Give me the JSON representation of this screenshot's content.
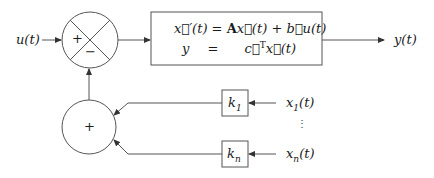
{
  "diagram": {
    "type": "block-diagram",
    "colors": {
      "stroke": "#555555",
      "text": "#1a1a1a",
      "background": "#ffffff"
    },
    "input": {
      "label": "u(t)"
    },
    "output": {
      "label": "y(t)"
    },
    "summing_junction_top": {
      "signs": {
        "left": "+",
        "bottom": "−"
      }
    },
    "summing_junction_bottom": {
      "sign": "+"
    },
    "state_space_block": {
      "line1": {
        "lhs": "x⃗′(t)",
        "op": "=",
        "rhs_A": "A",
        "rhs_x": "x⃗(t)",
        "plus": "+",
        "rhs_b": "b⃗u(t)"
      },
      "line2": {
        "lhs": "y",
        "op": "=",
        "rhs_c": "c⃗",
        "rhs_sup": "T",
        "rhs_x": "x⃗(t)"
      }
    },
    "gains": [
      {
        "label": "k",
        "sub": "1",
        "input_label": "x",
        "input_sub": "1",
        "input_arg": "(t)"
      },
      {
        "label": "k",
        "sub": "n",
        "input_label": "x",
        "input_sub": "n",
        "input_arg": "(t)"
      }
    ],
    "ellipsis": "⋮"
  }
}
